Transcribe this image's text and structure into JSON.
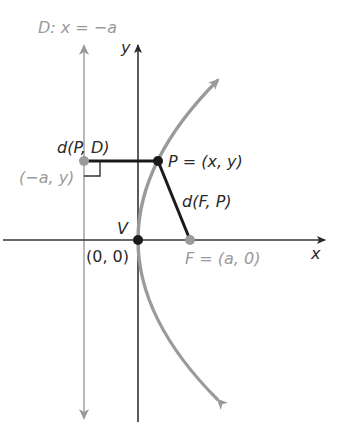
{
  "diagram": {
    "colors": {
      "axis": "#333333",
      "parabola": "#9a9a9a",
      "directrix": "#a8a8a8",
      "segment": "#1a1a1a",
      "gray_label": "#9a9a9a",
      "dark_label": "#2a2a2a"
    },
    "labels": {
      "directrix": "D: x = −a",
      "y_axis": "y",
      "x_axis": "x",
      "dist_PD": "d(P, D)",
      "point_on_directrix": "(−a, y)",
      "point_P": "P = (x, y)",
      "dist_FP": "d(F, P)",
      "vertex": "V",
      "origin": "(0, 0)",
      "focus": "F = (a, 0)"
    }
  }
}
